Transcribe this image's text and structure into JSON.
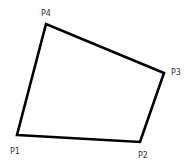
{
  "diagram": {
    "type": "quadrilateral",
    "stroke_color": "#000000",
    "fill_color": "#ffffff",
    "points": [
      {
        "label": "P1",
        "x": 17,
        "y": 135
      },
      {
        "label": "P2",
        "x": 140,
        "y": 142
      },
      {
        "label": "P3",
        "x": 164,
        "y": 73
      },
      {
        "label": "P4",
        "x": 46,
        "y": 24
      }
    ],
    "labels": {
      "p1": "P1",
      "p2": "P2",
      "p3": "P3",
      "p4": "P4"
    }
  }
}
